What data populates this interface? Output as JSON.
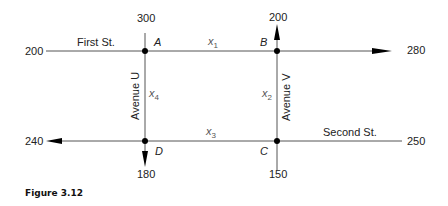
{
  "diagram": {
    "caption": "Figure 3.12",
    "streets": {
      "first": "First St.",
      "second": "Second St.",
      "avenue_u": "Avenue U",
      "avenue_v": "Avenue V"
    },
    "nodes": {
      "A": "A",
      "B": "B",
      "C": "C",
      "D": "D"
    },
    "variables": {
      "x1": {
        "base": "x",
        "sub": "1"
      },
      "x2": {
        "base": "x",
        "sub": "2"
      },
      "x3": {
        "base": "x",
        "sub": "3"
      },
      "x4": {
        "base": "x",
        "sub": "4"
      }
    },
    "flows": {
      "first_in_left": "200",
      "avenue_u_in_top": "300",
      "avenue_v_out_top": "200",
      "first_out_right": "280",
      "second_out_left": "240",
      "second_in_right": "250",
      "avenue_u_out_bottom": "180",
      "avenue_v_in_bottom": "150"
    },
    "colors": {
      "line": "#555555",
      "node": "#000000"
    }
  }
}
